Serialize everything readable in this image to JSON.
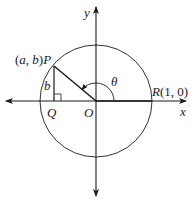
{
  "diagram": {
    "type": "unit-circle",
    "colors": {
      "stroke": "#1a1a1a",
      "background": "#ffffff"
    },
    "axes": {
      "x_label": "x",
      "y_label": "y"
    },
    "points": {
      "origin": {
        "label": "O"
      },
      "P": {
        "label": "P",
        "coord_label": "(a, b)"
      },
      "Q": {
        "label": "Q"
      },
      "R": {
        "label": "R",
        "coord_label": "(1, 0)"
      }
    },
    "segment_labels": {
      "PQ": "b"
    },
    "angle_label": "θ"
  }
}
